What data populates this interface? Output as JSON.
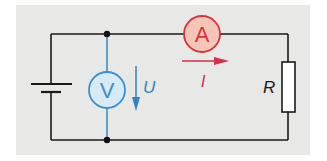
{
  "diagram": {
    "type": "electric-circuit",
    "components": {
      "battery": {
        "symbol": "battery-cell"
      },
      "ammeter": {
        "label": "A",
        "stroke": "#d9343a",
        "fill": "#f6c5b8"
      },
      "voltmeter": {
        "label": "V",
        "stroke": "#3a8fd0",
        "fill": "#d6ebf7"
      },
      "resistor": {
        "label": "R"
      }
    },
    "quantities": {
      "voltage": {
        "label": "U",
        "color": "#2f86c6",
        "direction": "down"
      },
      "current": {
        "label": "I",
        "color": "#d4304a",
        "direction": "right"
      }
    },
    "colors": {
      "background": "#e8e8e6",
      "wire": "#1a1a1a",
      "voltmeter_wire": "#3a8fd0"
    }
  }
}
